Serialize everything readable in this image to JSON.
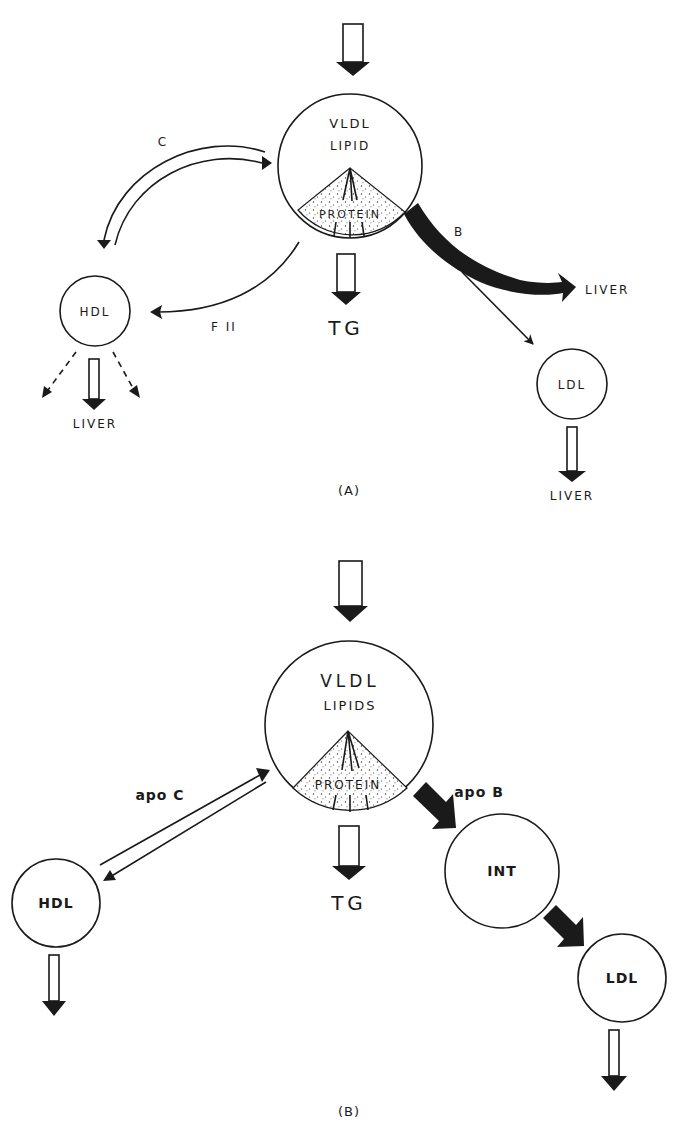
{
  "diagram": {
    "panel_a": {
      "caption": "(A)",
      "vldl": {
        "title": "VLDL",
        "subtitle": "LIPID",
        "core": "PROTEIN"
      },
      "hdl": {
        "label": "HDL",
        "output": "LIVER"
      },
      "ldl": {
        "label": "LDL",
        "output": "LIVER"
      },
      "tg_output": "TG",
      "arrow_c_label": "C",
      "arrow_fii_label": "F II",
      "arrow_b_label": "B",
      "arrow_b_target": "LIVER"
    },
    "panel_b": {
      "caption": "(B)",
      "vldl": {
        "title": "VLDL",
        "subtitle": "LIPIDS",
        "core": "PROTEIN"
      },
      "hdl": {
        "label": "HDL"
      },
      "int": {
        "label": "INT"
      },
      "ldl": {
        "label": "LDL"
      },
      "tg_output": "TG",
      "arrow_apoc_label": "apo C",
      "arrow_apob_label": "apo B"
    },
    "colors": {
      "ink": "#1a1a1a",
      "background": "#ffffff"
    }
  }
}
